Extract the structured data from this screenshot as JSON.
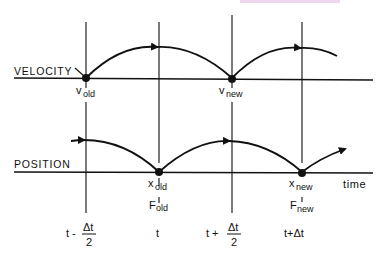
{
  "diagram": {
    "rows": {
      "velocity": {
        "label": "VELOCITY",
        "points": [
          {
            "name": "v",
            "sub": "old"
          },
          {
            "name": "v",
            "sub": "new"
          }
        ]
      },
      "position": {
        "label": "POSITION",
        "points": [
          {
            "name": "x",
            "sub": "old",
            "force": "F",
            "force_sub": "old"
          },
          {
            "name": "x",
            "sub": "new",
            "force": "F",
            "force_sub": "new"
          }
        ]
      }
    },
    "axis_label": "time",
    "time_ticks": [
      {
        "prefix": "t -",
        "num": "Δt",
        "den": "2"
      },
      {
        "prefix": "t"
      },
      {
        "prefix": "t +",
        "num": "Δt",
        "den": "2"
      },
      {
        "prefix": "t+Δt"
      }
    ],
    "colors": {
      "ink": "#111111",
      "accent_bar": "#f0d6ec"
    }
  }
}
